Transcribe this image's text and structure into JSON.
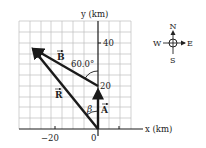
{
  "diagram": {
    "axes": {
      "x_label": "x (km)",
      "y_label": "y (km)",
      "x_ticks": [
        "−20",
        "0"
      ],
      "y_ticks": [
        "20",
        "40"
      ],
      "grid_spacing_km": 5
    },
    "vectors": {
      "A": {
        "label": "A",
        "from": [
          0,
          0
        ],
        "to": [
          0,
          20
        ],
        "description": "20 km due north"
      },
      "B": {
        "label": "B",
        "from": [
          0,
          20
        ],
        "to": [
          -30.3,
          37.5
        ],
        "description": "B at 60.0° west of north"
      },
      "R": {
        "label": "R",
        "from": [
          0,
          0
        ],
        "to": [
          -30.3,
          37.5
        ],
        "description": "Resultant"
      }
    },
    "angles": {
      "theta_label": "60.0°",
      "beta_label": "β"
    },
    "compass": {
      "north": "N",
      "south": "S",
      "east": "E",
      "west": "W"
    },
    "colors": {
      "vector": "#1a1a1a",
      "grid": "#bdbdbd",
      "axis": "#1a1a1a"
    }
  }
}
